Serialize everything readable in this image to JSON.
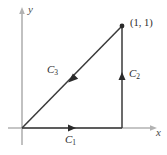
{
  "figure": {
    "name": "triangular-closed-path-diagram",
    "width": 167,
    "height": 155,
    "background_color": "#ffffff"
  },
  "axes": {
    "x_label": "x",
    "y_label": "y",
    "color": "#b0b0b0",
    "origin": {
      "x": 22,
      "y": 128
    },
    "x_axis": {
      "start_x": 8,
      "end_x": 157,
      "y": 128,
      "arrow": "right"
    },
    "y_axis": {
      "x": 22,
      "start_y": 145,
      "end_y": 7,
      "arrow": "up"
    }
  },
  "path": {
    "color": "#3a3a3a",
    "segments": [
      {
        "label": "C",
        "subscript": "1",
        "description": "bottom horizontal segment from origin to (1, 0)",
        "from": {
          "x": 22,
          "y": 128
        },
        "to": {
          "x": 122,
          "y": 128
        },
        "direction": "right",
        "arrow_at": {
          "x": 72,
          "y": 128
        }
      },
      {
        "label": "C",
        "subscript": "2",
        "description": "right vertical segment from (1, 0) to (1, 1)",
        "from": {
          "x": 122,
          "y": 128
        },
        "to": {
          "x": 122,
          "y": 26
        },
        "direction": "up",
        "arrow_at": {
          "x": 122,
          "y": 77
        }
      },
      {
        "label": "C",
        "subscript": "3",
        "description": "diagonal segment from (1, 1) back to origin",
        "from": {
          "x": 122,
          "y": 26
        },
        "to": {
          "x": 22,
          "y": 128
        },
        "direction": "down-left",
        "arrow_at": {
          "x": 72,
          "y": 78
        }
      }
    ]
  },
  "points": [
    {
      "label": "(1, 1)",
      "at": {
        "x": 122,
        "y": 26
      },
      "dot_color": "#2b2b2b"
    }
  ]
}
